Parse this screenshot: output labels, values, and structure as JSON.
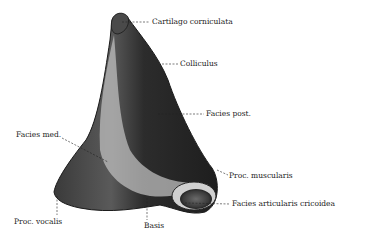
{
  "figure": {
    "labels": [
      {
        "id": "cartilago-corniculata",
        "text": "Cartilago corniculata",
        "x": 152,
        "y": 19
      },
      {
        "id": "colliculus",
        "text": "Colliculus",
        "x": 180,
        "y": 61
      },
      {
        "id": "facies-post",
        "text": "Facies post.",
        "x": 206,
        "y": 111
      },
      {
        "id": "facies-med",
        "text": "Facies med.",
        "x": 16,
        "y": 133
      },
      {
        "id": "proc-muscularis",
        "text": "Proc. muscularis",
        "x": 229,
        "y": 172
      },
      {
        "id": "facies-articularis-cricoidea",
        "text": "Facies articularis cricoidea",
        "x": 232,
        "y": 201
      },
      {
        "id": "proc-vocalis",
        "text": "Proc. vocalis",
        "x": 14,
        "y": 219
      },
      {
        "id": "basis",
        "text": "Basis",
        "x": 144,
        "y": 223
      }
    ]
  },
  "colors": {
    "background": "#ffffff",
    "dark": "#2a2a2a",
    "light": "#b8b8b8",
    "text": "#222222"
  }
}
